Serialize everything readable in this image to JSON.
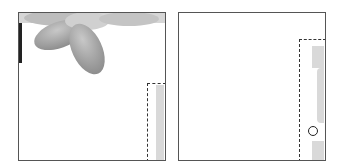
{
  "diagram": {
    "panels": [
      {
        "id": "left",
        "content": "flower-image-top-left",
        "selection": {
          "style": "dashed",
          "position": "bottom-right-strip"
        }
      },
      {
        "id": "right",
        "content": "blank",
        "selection": {
          "style": "dashed",
          "position": "right-strip"
        },
        "marker": "circle"
      }
    ],
    "colors": {
      "border": "#555555",
      "dashed": "#333333",
      "strip": "#d9d9d9",
      "petal": "#9a9a9a"
    }
  }
}
